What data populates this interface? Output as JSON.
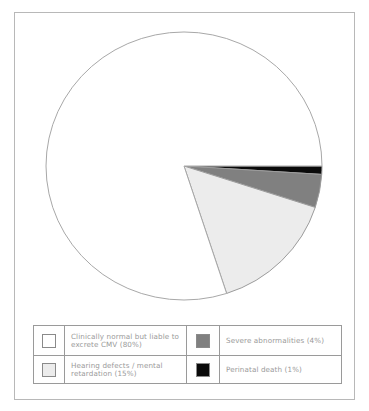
{
  "chart_data": {
    "type": "pie",
    "title": "",
    "categories": [
      "Clinically normal but liable to excrete CMV",
      "Hearing defects / mental retardation",
      "Severe abnormalities",
      "Perinatal death"
    ],
    "values": [
      80,
      15,
      4,
      1
    ],
    "unit": "%",
    "colors": [
      "#ffffff",
      "#ececec",
      "#808080",
      "#0a0a0a"
    ],
    "start_angle_deg": 0,
    "direction": "clockwise from 3 o'clock, ordered: Perinatal death, Severe abnormalities, Hearing defects, Clinically normal",
    "legend_position": "bottom"
  },
  "legend": {
    "items": [
      {
        "label": "Clinically normal but liable to excrete CMV (80%)",
        "color": "#ffffff"
      },
      {
        "label": "Severe abnormalities (4%)",
        "color": "#808080"
      },
      {
        "label": "Hearing defects / mental retardation (15%)",
        "color": "#ececec"
      },
      {
        "label": "Perinatal death (1%)",
        "color": "#0a0a0a"
      }
    ]
  }
}
